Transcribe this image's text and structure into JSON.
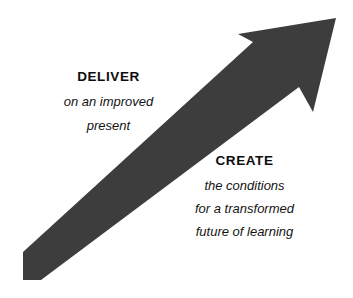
{
  "canvas": {
    "width": 353,
    "height": 298,
    "background_color": "#ffffff"
  },
  "arrow": {
    "name": "upward-diagonal-arrow",
    "fill_color": "#3d3d3d",
    "direction": "up-right",
    "tail_point": "23,280",
    "tip_point": "336,18",
    "shaft_thickness_px": 28,
    "angle_degrees": 40,
    "head_style": "concave-barbed"
  },
  "blocks": [
    {
      "id": "deliver",
      "heading": "DELIVER",
      "lines": [
        "on an improved",
        "present"
      ]
    },
    {
      "id": "create",
      "heading": "CREATE",
      "lines": [
        "the conditions",
        "for a transformed",
        "future of learning"
      ]
    }
  ],
  "colors": {
    "arrow": "#3d3d3d",
    "heading_text": "#0d0d0d",
    "body_text": "#141414",
    "background": "#ffffff"
  }
}
